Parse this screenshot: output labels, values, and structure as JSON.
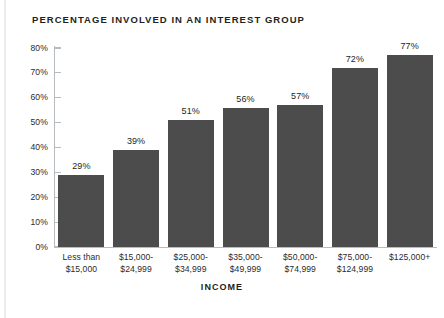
{
  "chart_data": {
    "type": "bar",
    "title": "PERCENTAGE INVOLVED IN AN INTEREST GROUP",
    "xlabel": "INCOME",
    "ylabel": "",
    "categories": [
      "Less than $15,000",
      "$15,000-$24,999",
      "$25,000-$34,999",
      "$35,000-$49,999",
      "$50,000-$74,999",
      "$75,000-$124,999",
      "$125,000+"
    ],
    "category_lines": [
      [
        "Less than",
        "$15,000"
      ],
      [
        "$15,000-",
        "$24,999"
      ],
      [
        "$25,000-",
        "$34,999"
      ],
      [
        "$35,000-",
        "$49,999"
      ],
      [
        "$50,000-",
        "$74,999"
      ],
      [
        "$75,000-",
        "$124,999"
      ],
      [
        "$125,000+",
        ""
      ]
    ],
    "values": [
      29,
      39,
      51,
      56,
      57,
      72,
      77
    ],
    "value_labels": [
      "29%",
      "39%",
      "51%",
      "56%",
      "57%",
      "72%",
      "77%"
    ],
    "ylim": [
      0,
      80
    ],
    "ytick_values": [
      0,
      10,
      20,
      30,
      40,
      50,
      60,
      70,
      80
    ],
    "ytick_labels": [
      "0%",
      "10%",
      "20%",
      "30%",
      "40%",
      "50%",
      "60%",
      "70%",
      "80%"
    ],
    "grid": false,
    "legend": null,
    "bar_color": "#4c4c4c",
    "axis_color": "#b9bcbe",
    "text_color": "#231f20",
    "background": "#ffffff"
  }
}
